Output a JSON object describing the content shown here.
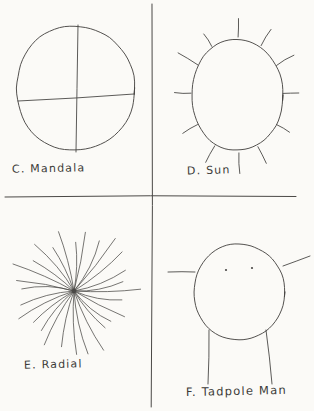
{
  "page": {
    "background_color": "#fbfaf7",
    "ink_color": "#4a4846",
    "width": 314,
    "height": 411,
    "medium": "pencil on paper"
  },
  "dividers": {
    "vertical": {
      "x": 152,
      "y1": 4,
      "y2": 407
    },
    "horizontal": {
      "y": 196,
      "x1": 5,
      "x2": 296
    }
  },
  "quadrants": [
    {
      "id": "mandala",
      "position": "top-left",
      "label": "C. Mandala",
      "drawing_name": "mandala-drawing",
      "description": "irregular circle divided by a vertical and a horizontal line into four parts"
    },
    {
      "id": "sun",
      "position": "top-right",
      "label": "D. Sun",
      "drawing_name": "sun-drawing",
      "description": "closed oval with short straight rays radiating outward around the perimeter",
      "ray_count": 12
    },
    {
      "id": "radial",
      "position": "bottom-left",
      "label": "E. Radial",
      "drawing_name": "radial-drawing",
      "description": "many long lines radiating outward from one dense central point",
      "ray_count": 28
    },
    {
      "id": "tadpole",
      "position": "bottom-right",
      "label": "F. Tadpole Man",
      "drawing_name": "tadpole-man-drawing",
      "description": "large circular head with two dot eyes, two arms from the sides and two legs below",
      "eye_count": 2,
      "arm_count": 2,
      "leg_count": 2
    }
  ]
}
